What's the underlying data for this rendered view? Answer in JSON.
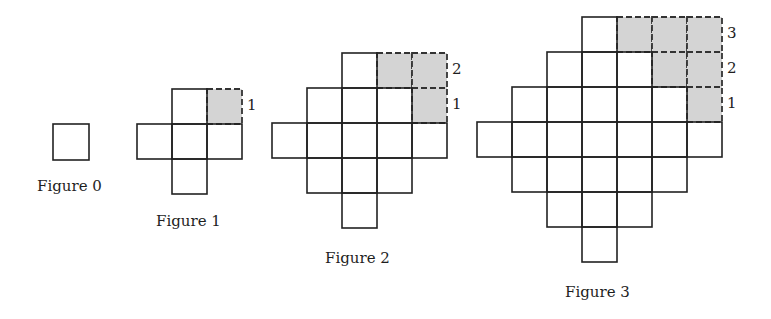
{
  "diagram": {
    "colors": {
      "stroke": "#222222",
      "shaded_fill": "#d4d4d4",
      "dashed_stroke": "#333333",
      "background": "#ffffff"
    },
    "figures": [
      {
        "caption": "Figure 0",
        "origin": [
          53,
          124
        ],
        "cell": 36,
        "solid": [
          [
            0,
            0
          ]
        ],
        "shaded": [],
        "labels": [],
        "caption_pos": [
          37,
          179
        ]
      },
      {
        "caption": "Figure 1",
        "origin": [
          137,
          89
        ],
        "cell": 35,
        "solid": [
          [
            1,
            0
          ],
          [
            0,
            1
          ],
          [
            1,
            1
          ],
          [
            2,
            1
          ],
          [
            1,
            2
          ]
        ],
        "shaded": [
          [
            2,
            0
          ]
        ],
        "labels": [
          {
            "text": "1",
            "row": 0
          }
        ],
        "caption_pos": [
          156,
          214
        ]
      },
      {
        "caption": "Figure 2",
        "origin": [
          272,
          53
        ],
        "cell": 35,
        "solid": [
          [
            2,
            0
          ],
          [
            1,
            1
          ],
          [
            2,
            1
          ],
          [
            3,
            1
          ],
          [
            0,
            2
          ],
          [
            1,
            2
          ],
          [
            2,
            2
          ],
          [
            3,
            2
          ],
          [
            4,
            2
          ],
          [
            1,
            3
          ],
          [
            2,
            3
          ],
          [
            3,
            3
          ],
          [
            2,
            4
          ]
        ],
        "shaded": [
          [
            3,
            0
          ],
          [
            4,
            0
          ],
          [
            4,
            1
          ]
        ],
        "labels": [
          {
            "text": "2",
            "row": 0
          },
          {
            "text": "1",
            "row": 1
          }
        ],
        "caption_pos": [
          325,
          251
        ]
      },
      {
        "caption": "Figure 3",
        "origin": [
          477,
          17
        ],
        "cell": 35,
        "solid": [
          [
            3,
            0
          ],
          [
            2,
            1
          ],
          [
            3,
            1
          ],
          [
            4,
            1
          ],
          [
            1,
            2
          ],
          [
            2,
            2
          ],
          [
            3,
            2
          ],
          [
            4,
            2
          ],
          [
            5,
            2
          ],
          [
            0,
            3
          ],
          [
            1,
            3
          ],
          [
            2,
            3
          ],
          [
            3,
            3
          ],
          [
            4,
            3
          ],
          [
            5,
            3
          ],
          [
            6,
            3
          ],
          [
            1,
            4
          ],
          [
            2,
            4
          ],
          [
            3,
            4
          ],
          [
            4,
            4
          ],
          [
            5,
            4
          ],
          [
            2,
            5
          ],
          [
            3,
            5
          ],
          [
            4,
            5
          ],
          [
            3,
            6
          ]
        ],
        "shaded": [
          [
            4,
            0
          ],
          [
            5,
            0
          ],
          [
            6,
            0
          ],
          [
            5,
            1
          ],
          [
            6,
            1
          ],
          [
            6,
            2
          ]
        ],
        "labels": [
          {
            "text": "3",
            "row": 0
          },
          {
            "text": "2",
            "row": 1
          },
          {
            "text": "1",
            "row": 2
          }
        ],
        "caption_pos": [
          565,
          285
        ]
      }
    ]
  }
}
